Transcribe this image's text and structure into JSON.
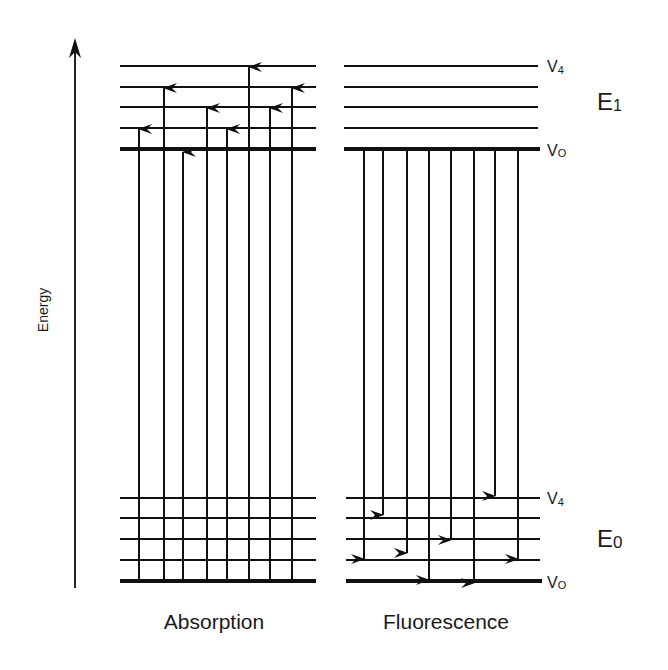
{
  "axis": {
    "label": "Energy"
  },
  "states": {
    "excited": {
      "label": "E1",
      "main": "E",
      "sub": "1",
      "top_level": "V4",
      "bottom_level": "V0"
    },
    "ground": {
      "label": "E0",
      "main": "E",
      "sub": "0",
      "top_level": "V4",
      "bottom_level": "V0"
    }
  },
  "level_labels": {
    "v4": "V4",
    "v4_main": "V",
    "v4_sub": "4",
    "v0": "V0",
    "v0_main": "V",
    "v0_sub": "O"
  },
  "panels": {
    "absorption": {
      "label": "Absorption"
    },
    "fluorescence": {
      "label": "Fluorescence"
    }
  },
  "diagram": {
    "excited_levels_y": [
      66,
      87,
      107,
      128,
      149
    ],
    "ground_levels_y": [
      498,
      518,
      539,
      560,
      581
    ],
    "absorption_arrows": [
      {
        "x": 139,
        "to_level": "V1"
      },
      {
        "x": 164,
        "to_level": "V3"
      },
      {
        "x": 183,
        "to_level": "below V0"
      },
      {
        "x": 207,
        "to_level": "V2"
      },
      {
        "x": 227,
        "to_level": "V1"
      },
      {
        "x": 249,
        "to_level": "V4"
      },
      {
        "x": 270,
        "to_level": "V2"
      },
      {
        "x": 292,
        "to_level": "V3"
      }
    ],
    "fluorescence_arrows": [
      {
        "x": 364,
        "to_level": "V1"
      },
      {
        "x": 383,
        "to_level": "V4-V3"
      },
      {
        "x": 407,
        "to_level": "V1-V2"
      },
      {
        "x": 429,
        "to_level": "V0"
      },
      {
        "x": 451,
        "to_level": "V2"
      },
      {
        "x": 474,
        "to_level": "V0"
      },
      {
        "x": 495,
        "to_level": "above V4"
      },
      {
        "x": 518,
        "to_level": "V1"
      }
    ]
  }
}
